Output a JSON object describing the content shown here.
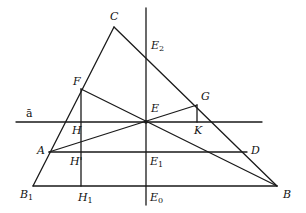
{
  "diagram": {
    "points": {
      "C": {
        "label": "C",
        "sub": "",
        "x": 114,
        "y": 27
      },
      "E2": {
        "label": "E",
        "sub": "2",
        "x": 146,
        "y": 43
      },
      "F": {
        "label": "F",
        "sub": "",
        "x": 81,
        "y": 89
      },
      "G": {
        "label": "G",
        "sub": "",
        "x": 197,
        "y": 105
      },
      "E": {
        "label": "E",
        "sub": "",
        "x": 146,
        "y": 122
      },
      "H": {
        "label": "H",
        "sub": "",
        "x": 81,
        "y": 122
      },
      "K": {
        "label": "K",
        "sub": "",
        "x": 197,
        "y": 122
      },
      "A": {
        "label": "A",
        "sub": "",
        "x": 49,
        "y": 152
      },
      "H'": {
        "label": "H'",
        "sub": "",
        "x": 81,
        "y": 152
      },
      "E1": {
        "label": "E",
        "sub": "1",
        "x": 146,
        "y": 152
      },
      "D": {
        "label": "D",
        "sub": "",
        "x": 247,
        "y": 152
      },
      "B1": {
        "label": "B",
        "sub": "1",
        "x": 33,
        "y": 186
      },
      "H1": {
        "label": "H",
        "sub": "1",
        "x": 81,
        "y": 186
      },
      "E0": {
        "label": "E",
        "sub": "0",
        "x": 146,
        "y": 186
      },
      "B": {
        "label": "B",
        "sub": "",
        "x": 277,
        "y": 186
      }
    },
    "line_label": "ā",
    "stroke_color": "#1a1a1a"
  },
  "labels": {
    "C": "C",
    "E2": "E",
    "E2_sub": "2",
    "F": "F",
    "G": "G",
    "E": "E",
    "H": "H",
    "K": "K",
    "A": "A",
    "Hp": "H'",
    "E1": "E",
    "E1_sub": "1",
    "D": "D",
    "B1": "B",
    "B1_sub": "1",
    "H1": "H",
    "H1_sub": "1",
    "E0": "E",
    "E0_sub": "0",
    "B": "B",
    "a_bar": "ā"
  }
}
